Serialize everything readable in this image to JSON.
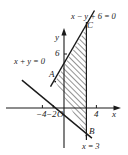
{
  "figure": {
    "background_color": "#ffffff",
    "stroke_color": "#1a1a1a",
    "hatch_color": "#3a3a3a"
  },
  "axes": {
    "x_axis_label": "x",
    "y_axis_label": "y",
    "origin_label": "O",
    "x_ticks": [
      {
        "label": "−4",
        "value": -4
      },
      {
        "label": "−2",
        "value": -2
      },
      {
        "label": "4",
        "value": 4
      }
    ],
    "y_ticks": [
      {
        "label": "6",
        "value": 6
      }
    ]
  },
  "lines": [
    {
      "name": "line-x-minus-y-plus-6",
      "label": "x − y + 6 = 0",
      "equation": "x-y+6=0",
      "slope": 1,
      "intercept": 6
    },
    {
      "name": "line-x-plus-y",
      "label": "x + y = 0",
      "equation": "x+y=0",
      "slope": -1,
      "intercept": 0
    },
    {
      "name": "line-x-equals-3",
      "label": "x = 3",
      "equation": "x=3",
      "vertical_at": 3
    }
  ],
  "points": [
    {
      "name": "point-A",
      "label": "A",
      "x": -3,
      "y": 3
    },
    {
      "name": "point-B",
      "label": "B",
      "x": 3,
      "y": -3
    },
    {
      "name": "point-C",
      "label": "C",
      "x": 3,
      "y": 9
    }
  ],
  "region": {
    "name": "feasible-region",
    "fill": "diagonal-hatch",
    "vertices": [
      "A",
      "B",
      "C"
    ]
  }
}
